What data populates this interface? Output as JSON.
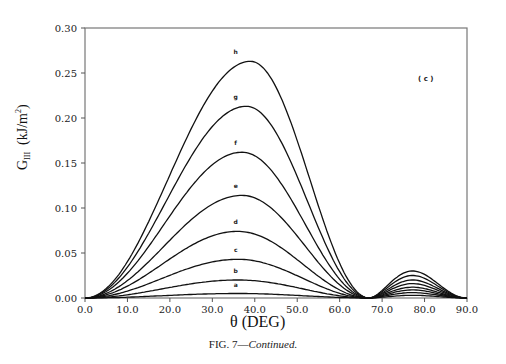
{
  "caption": {
    "prefix": "FIG. 7—",
    "italic": "Continued."
  },
  "panel_label": "( c )",
  "x_axis_label": "θ   (DEG)",
  "y_axis_label": "G III   (kJ/m²)",
  "chart_data": {
    "type": "line",
    "title": "",
    "panel": "(c)",
    "xlabel": "θ (DEG)",
    "ylabel": "G_III (kJ/m²)",
    "xlim": [
      0,
      90
    ],
    "ylim": [
      0,
      0.3
    ],
    "xticks": [
      "0.0",
      "10.0",
      "20.0",
      "30.0",
      "40.0",
      "50.0",
      "60.0",
      "70.0",
      "80.0",
      "90.0"
    ],
    "yticks": [
      "0.00",
      "0.05",
      "0.10",
      "0.15",
      "0.20",
      "0.25",
      "0.30"
    ],
    "grid": false,
    "legend": "curve labels inline above peaks",
    "series": [
      {
        "name": "a",
        "peak_x": 36,
        "peak_y": 0.005,
        "secondary_peak_x": 76,
        "secondary_peak_y": 0.003
      },
      {
        "name": "b",
        "peak_x": 36,
        "peak_y": 0.02,
        "secondary_peak_x": 76,
        "secondary_peak_y": 0.006
      },
      {
        "name": "c",
        "peak_x": 36,
        "peak_y": 0.043,
        "secondary_peak_x": 76,
        "secondary_peak_y": 0.009
      },
      {
        "name": "d",
        "peak_x": 36,
        "peak_y": 0.074,
        "secondary_peak_x": 76,
        "secondary_peak_y": 0.012
      },
      {
        "name": "e",
        "peak_x": 37,
        "peak_y": 0.114,
        "secondary_peak_x": 76,
        "secondary_peak_y": 0.016
      },
      {
        "name": "f",
        "peak_x": 37,
        "peak_y": 0.162,
        "secondary_peak_x": 76,
        "secondary_peak_y": 0.02
      },
      {
        "name": "g",
        "peak_x": 38,
        "peak_y": 0.213,
        "secondary_peak_x": 76,
        "secondary_peak_y": 0.025
      },
      {
        "name": "h",
        "peak_x": 39,
        "peak_y": 0.263,
        "secondary_peak_x": 76,
        "secondary_peak_y": 0.03
      }
    ]
  }
}
